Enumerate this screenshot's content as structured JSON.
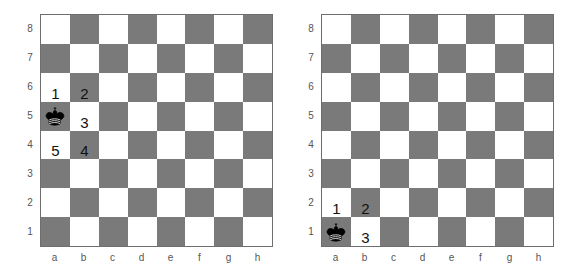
{
  "boards": [
    {
      "name": "board-left",
      "left": 40,
      "files": [
        "a",
        "b",
        "c",
        "d",
        "e",
        "f",
        "g",
        "h"
      ],
      "ranks": [
        "8",
        "7",
        "6",
        "5",
        "4",
        "3",
        "2",
        "1"
      ],
      "piece": {
        "type": "king",
        "color": "black",
        "square": "a5"
      },
      "markers": [
        {
          "square": "a6",
          "label": "1"
        },
        {
          "square": "b6",
          "label": "2"
        },
        {
          "square": "b5",
          "label": "3"
        },
        {
          "square": "b4",
          "label": "4"
        },
        {
          "square": "a4",
          "label": "5"
        }
      ]
    },
    {
      "name": "board-right",
      "left": 321,
      "files": [
        "a",
        "b",
        "c",
        "d",
        "e",
        "f",
        "g",
        "h"
      ],
      "ranks": [
        "8",
        "7",
        "6",
        "5",
        "4",
        "3",
        "2",
        "1"
      ],
      "piece": {
        "type": "king",
        "color": "black",
        "square": "a1"
      },
      "markers": [
        {
          "square": "a2",
          "label": "1"
        },
        {
          "square": "b2",
          "label": "2"
        },
        {
          "square": "b1",
          "label": "3"
        }
      ]
    }
  ],
  "colors": {
    "light": "#ffffff",
    "dark": "#7a7a7a",
    "border": "#6e6e6e",
    "label": "#555555"
  }
}
